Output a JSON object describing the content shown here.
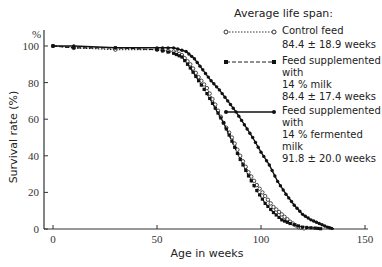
{
  "chart_data": {
    "type": "line",
    "title": "Average life span:",
    "xlabel": "Age in weeks",
    "ylabel": "Survival rate (%)",
    "y_unit_label": "%",
    "xlim": [
      0,
      150
    ],
    "ylim": [
      0,
      100
    ],
    "x_ticks": [
      0,
      50,
      100,
      150
    ],
    "y_ticks": [
      0,
      20,
      40,
      60,
      80,
      100
    ],
    "grid": false,
    "legend_position": "upper right",
    "series": [
      {
        "name": "Control feed",
        "style": "dotted, open circles",
        "average_life_span": "84.4 ± 18.9 weeks",
        "x": [
          0,
          10,
          30,
          50,
          58,
          62,
          66,
          70,
          74,
          78,
          82,
          86,
          90,
          94,
          98,
          102,
          106,
          110,
          114,
          118,
          122
        ],
        "y": [
          100,
          99,
          98,
          98,
          97,
          95,
          90,
          83,
          77,
          68,
          58,
          50,
          40,
          31,
          24,
          18,
          12,
          8,
          4,
          1,
          0
        ]
      },
      {
        "name": "Feed supplemented with 14 % milk",
        "style": "dashed, filled squares",
        "average_life_span": "84.4 ± 17.4 weeks",
        "x": [
          0,
          10,
          30,
          50,
          58,
          62,
          66,
          70,
          74,
          78,
          82,
          86,
          90,
          94,
          98,
          102,
          106,
          110,
          114,
          120,
          126,
          130
        ],
        "y": [
          100,
          99,
          99,
          98,
          96,
          94,
          88,
          81,
          74,
          66,
          58,
          48,
          38,
          29,
          21,
          14,
          9,
          5,
          3,
          1,
          0.5,
          0
        ]
      },
      {
        "name": "Feed supplemented with 14 % fermented milk",
        "style": "solid, filled circles",
        "average_life_span": "91.8 ± 20.0 weeks",
        "x": [
          0,
          10,
          30,
          50,
          58,
          64,
          68,
          72,
          76,
          80,
          84,
          88,
          92,
          96,
          100,
          104,
          108,
          112,
          116,
          120,
          124,
          128,
          132,
          135
        ],
        "y": [
          100,
          100,
          99,
          99,
          99,
          97,
          93,
          87,
          81,
          76,
          70,
          64,
          57,
          50,
          42,
          35,
          26,
          19,
          13,
          8,
          5,
          3,
          1,
          0
        ]
      }
    ]
  },
  "legend": {
    "title": "Average life span:",
    "items": [
      {
        "label": "Control feed",
        "label2": "",
        "value": "84.4 ± 18.9 weeks"
      },
      {
        "label": "Feed supplemented with",
        "label2": "14 % milk",
        "value": "84.4 ± 17.4 weeks"
      },
      {
        "label": "Feed supplemented with",
        "label2": "14 % fermented milk",
        "value": "91.8 ± 20.0 weeks"
      }
    ]
  }
}
